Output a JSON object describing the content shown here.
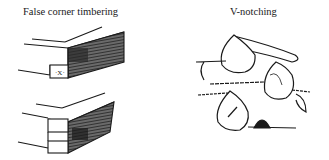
{
  "figures": [
    {
      "id": "false-corner-timbering",
      "caption": "False corner timbering"
    },
    {
      "id": "v-notching",
      "caption": "V-notching"
    }
  ],
  "colors": {
    "ink": "#1a1a1a",
    "shade": "#3a3a3a",
    "background": "#ffffff"
  }
}
